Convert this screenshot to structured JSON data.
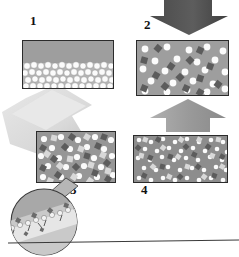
{
  "figure": {
    "type": "process-diagram",
    "background_color": "#ffffff"
  },
  "colors": {
    "matrix_gray": "#9e9e9e",
    "matrix_gray_dark": "#8d8d8d",
    "panel_border": "#2b2b2b",
    "particle_white": "#fbfbfb",
    "particle_dark": "#5c5c5c",
    "particle_light": "#d8d8d8",
    "arrow_dark": "#555555",
    "arrow_mid": "#9a9a9a",
    "arrow_light": "#d9d9d9",
    "label_text": "#111111",
    "callout_fill": "#a8a8a8",
    "callout_lower": "#d0d0d0",
    "callout_band": "#e8e8e8"
  },
  "panels": [
    {
      "id": "panel-1",
      "label": "1",
      "x": 22,
      "y": 40,
      "w": 92,
      "h": 49,
      "label_x": 30,
      "label_y": 20,
      "fill": "#9e9e9e",
      "content": "upper gray matrix layer over a densely packed bed of white spherical particles",
      "layer_split_ratio": 0.45,
      "particle_kinds": [
        "white-circle"
      ]
    },
    {
      "id": "panel-2",
      "label": "2",
      "x": 136,
      "y": 40,
      "w": 93,
      "h": 56,
      "label_x": 144,
      "label_y": 24,
      "fill": "#9e9e9e",
      "content": "gray matrix with dispersed white circles and dark diamond particles",
      "particle_kinds": [
        "white-circle",
        "dark-diamond"
      ]
    },
    {
      "id": "panel-3",
      "label": "3",
      "x": 36,
      "y": 131,
      "w": 80,
      "h": 52,
      "label_x": 70,
      "label_y": 188,
      "fill": "#969696",
      "content": "gray matrix with white circles, dark diamonds and light gray squares",
      "particle_kinds": [
        "white-circle",
        "dark-diamond",
        "light-square"
      ]
    },
    {
      "id": "panel-4",
      "label": "4",
      "x": 133,
      "y": 135,
      "w": 95,
      "h": 48,
      "label_x": 141,
      "label_y": 188,
      "fill": "#8d8d8d",
      "content": "densely packed fine mixture of white, light gray and dark particles",
      "particle_kinds": [
        "white-circle",
        "dark-diamond",
        "light-square"
      ]
    }
  ],
  "arrows": [
    {
      "id": "arrow-down-to-panel-2",
      "direction": "down",
      "color": "#555555",
      "x": 150,
      "y": 1,
      "w": 78,
      "h": 34
    },
    {
      "id": "arrow-up-to-panel-2",
      "direction": "up",
      "color": "#9a9a9a",
      "x": 150,
      "y": 99,
      "w": 76,
      "h": 32
    },
    {
      "id": "arrow-diagonal-to-panel-3",
      "direction": "down-left",
      "color": "#d9d9d9",
      "x": 2,
      "y": 86,
      "w": 80,
      "h": 80
    }
  ],
  "callout": {
    "id": "magnified-inset",
    "shape": "circle",
    "cx": 44,
    "cy": 222,
    "r": 34,
    "pointer_from": {
      "x": 68,
      "y": 190
    },
    "description": "magnified view of the particle-decorated interface in panel 3",
    "band_angle_deg": -22,
    "particle_count": 18
  },
  "baseline": {
    "id": "baseline-rule",
    "x1": 8,
    "y1": 243,
    "x2": 239,
    "y2": 240,
    "color": "#3a3a3a"
  }
}
